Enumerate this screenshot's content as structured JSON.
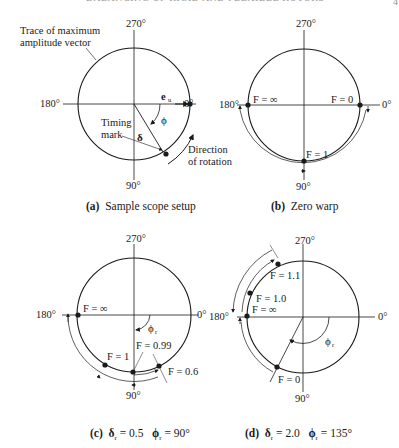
{
  "header": {
    "running_title": "BALANCING OF RIGID AND FLEXIBLE ROTORS",
    "page_mark": "4"
  },
  "axis_labels": {
    "deg0": "0°",
    "deg90": "90°",
    "deg180": "180°",
    "deg270": "270°"
  },
  "panels": {
    "a": {
      "caption_tag": "(a)",
      "caption_text": "Sample scope setup",
      "trace_label_line1": "Trace of maximum",
      "trace_label_line2": "amplitude vector",
      "eu_label": "e",
      "eu_sub": "u",
      "phi_label": "ϕ",
      "delta_label": "δ",
      "timing_line1": "Timing",
      "timing_line2": "mark",
      "rotation_line1": "Direction",
      "rotation_line2": "of rotation"
    },
    "b": {
      "caption_tag": "(b)",
      "caption_text": "Zero warp",
      "f_inf": "F = ∞",
      "f_zero": "F = 0",
      "f_one": "F = 1"
    },
    "c": {
      "caption_tag": "(c)",
      "caption_delta": "δ",
      "caption_delta_sub": "r",
      "caption_delta_val": " = 0.5",
      "caption_phi": "ϕ",
      "caption_phi_sub": "r",
      "caption_phi_val": " = 90°",
      "f_inf": "F = ∞",
      "f_one": "F = 1",
      "f_099": "F = 0.99",
      "f_06": "F = 0.6",
      "phi_label": "ϕ",
      "phi_sub": "r"
    },
    "d": {
      "caption_tag": "(d)",
      "caption_delta": "δ",
      "caption_delta_sub": "r",
      "caption_delta_val": " = 2.0",
      "caption_phi": "ϕ",
      "caption_phi_sub": "r",
      "caption_phi_val": " = 135°",
      "f_11": "F = 1.1",
      "f_10": "F = 1.0",
      "f_inf": "F = ∞",
      "f_zero": "F = 0",
      "phi_label": "ϕ",
      "phi_sub": "r"
    }
  }
}
